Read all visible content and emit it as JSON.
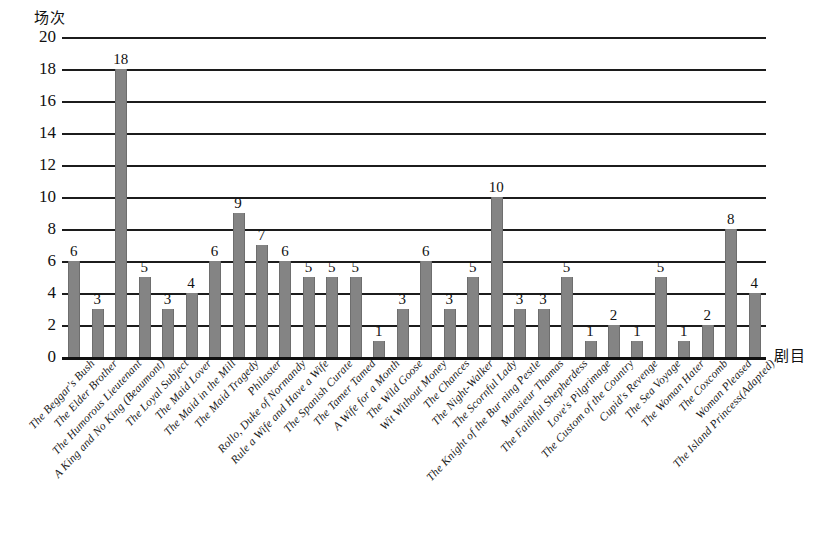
{
  "chart_data": {
    "type": "bar",
    "title": "",
    "ylabel": "场次",
    "xlabel": "剧目",
    "ylim": [
      0,
      20
    ],
    "ytick_step": 2,
    "yticks": [
      0,
      2,
      4,
      6,
      8,
      10,
      12,
      14,
      16,
      18,
      20
    ],
    "grid": true,
    "legend": "none",
    "bar_color": "#848484",
    "axis_color": "#1c1c1c",
    "categories": [
      "The Beggar's Bush",
      "The Elder Brother",
      "The Humorous Lieutenant",
      "A King and No King (Beaumont)",
      "The Loyal Subject",
      "The Maid Lover",
      "The Maid in the Mill",
      "The Maid Tragedy",
      "Philaster",
      "Rollo, Duke of Normandy",
      "Rule a Wife and Have a Wife",
      "The Spanish Curate",
      "The Tamer Tamed",
      "A Wife for a Month",
      "The Wild Goose",
      "Wit Without Money",
      "The Chances",
      "The Night-Walker",
      "The Scornful Lady",
      "The Knight of the Bur ning Pestle",
      "Monsieur Thamas",
      "The Faithful Shepherdess",
      "Love's Pilgrimage",
      "The Custom of the Country",
      "Cupid's Revenge",
      "The Sea Voyage",
      "The Woman Hater",
      "The Coxcomb",
      "Woman Pleased",
      "The Island Princess(Adapted)"
    ],
    "values": [
      6,
      3,
      18,
      5,
      3,
      4,
      6,
      9,
      7,
      6,
      5,
      5,
      5,
      1,
      3,
      6,
      3,
      5,
      10,
      3,
      3,
      5,
      1,
      2,
      1,
      5,
      1,
      2,
      8,
      4
    ]
  }
}
